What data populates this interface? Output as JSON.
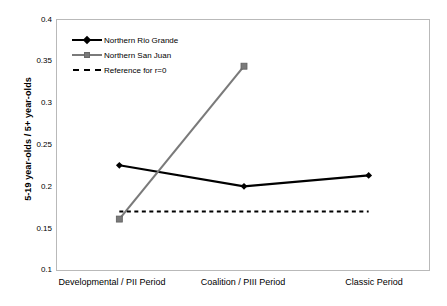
{
  "chart_data": {
    "type": "line",
    "title": "",
    "xlabel": "",
    "ylabel": "5-19 year-olds / 5+ year-olds",
    "categories": [
      "Developmental / PII Period",
      "Coalition / PIII Period",
      "Classic Period"
    ],
    "ylim": [
      0.1,
      0.4
    ],
    "yticks": [
      0.1,
      0.15,
      0.2,
      0.25,
      0.3,
      0.35,
      0.4
    ],
    "ytick_labels": [
      "0.1",
      "0.15",
      "0.2",
      "0.25",
      "0.3",
      "0.35",
      "0.4"
    ],
    "grid": false,
    "legend_position": "upper-left inside plot",
    "series": [
      {
        "name": "Northern Rio Grande",
        "values": [
          0.227,
          0.202,
          0.215
        ],
        "color": "#000000",
        "marker": "diamond",
        "linestyle": "solid"
      },
      {
        "name": "Northern San Juan",
        "values": [
          0.163,
          0.345,
          null
        ],
        "color": "#7a7a7a",
        "marker": "square",
        "linestyle": "solid"
      },
      {
        "name": "Reference for r=0",
        "values": [
          0.172,
          0.172,
          0.172
        ],
        "color": "#000000",
        "marker": "none",
        "linestyle": "dashed"
      }
    ]
  },
  "axis": {
    "y_title": "5-19 year-olds / 5+ year-olds",
    "y_tick_labels": [
      "0.4",
      "0.35",
      "0.3",
      "0.25",
      "0.2",
      "0.15",
      "0.1"
    ],
    "x_tick_labels": [
      "Developmental / PII Period",
      "Coalition / PIII Period",
      "Classic Period"
    ]
  },
  "legend": {
    "entries": [
      {
        "label": "Northern Rio Grande",
        "marker": "diamond-marker-icon"
      },
      {
        "label": "Northern San Juan",
        "marker": "square-marker-icon"
      },
      {
        "label": "Reference for r=0",
        "marker": "dashed-line-icon"
      }
    ]
  }
}
